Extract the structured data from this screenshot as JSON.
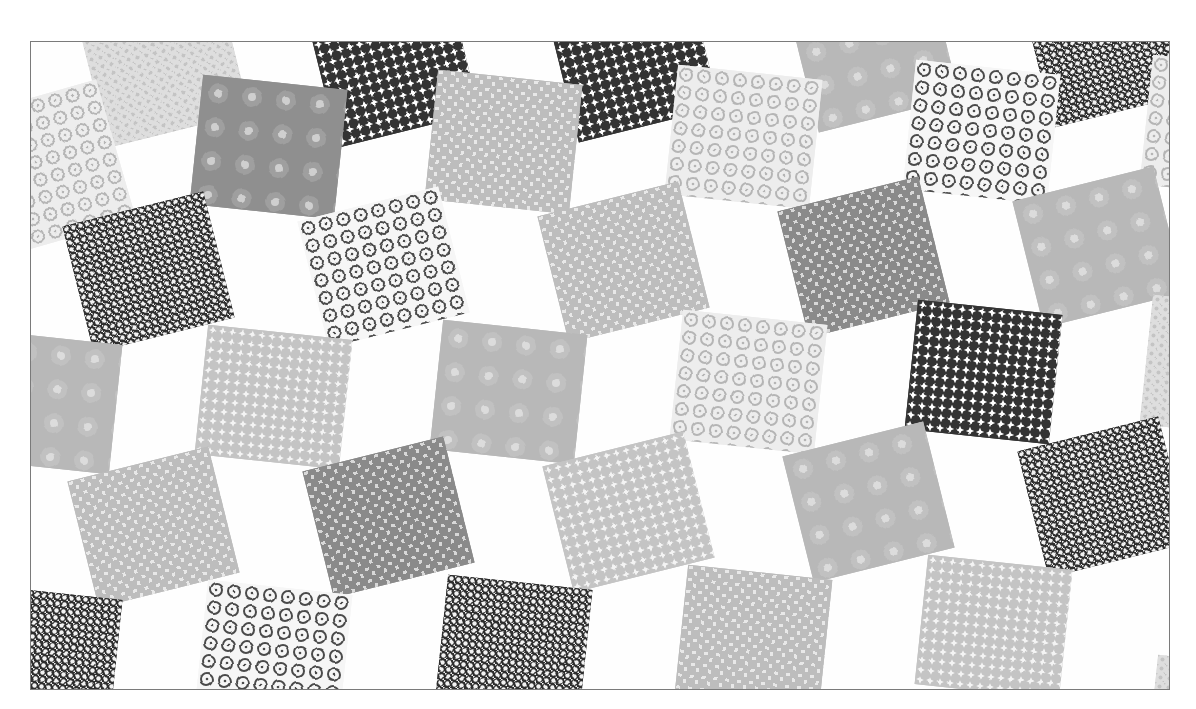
{
  "image": {
    "description": "Greyscale photograph of a patchwork quilt: rotated square print-fabric patches alternating with white rhombus patches in a tumbling-block style layout",
    "frame": {
      "left": 30,
      "top": 41,
      "width": 1140,
      "height": 649,
      "border_color": "#7a7a7a"
    },
    "background_color": "#ffffff"
  },
  "patterns": {
    "dark_floral": {
      "bg": "#2e2e2e",
      "fg": "#f2f2f2",
      "kind": "dots",
      "size": 7,
      "dot": 2.2
    },
    "dark_stars": {
      "bg": "#333333",
      "fg": "#ffffff",
      "kind": "stars",
      "size": 10,
      "dot": 2.6
    },
    "open_flowers": {
      "bg": "#f6f6f6",
      "fg": "#4a4a4a",
      "kind": "rings",
      "size": 18,
      "dot": 6
    },
    "weave_mid": {
      "bg": "#8a8a8a",
      "fg": "#d8d8d8",
      "kind": "weave",
      "size": 12,
      "dot": 3
    },
    "weave_light": {
      "bg": "#bdbdbd",
      "fg": "#e8e8e8",
      "kind": "weave",
      "size": 12,
      "dot": 3
    },
    "mottled_mid": {
      "bg": "#8f8f8f",
      "fg": "#cfcfcf",
      "kind": "spots",
      "size": 34,
      "dot": 4
    },
    "mottled_light": {
      "bg": "#b8b8b8",
      "fg": "#dcdcdc",
      "kind": "spots",
      "size": 34,
      "dot": 4
    },
    "pale_stars": {
      "bg": "#c4c4c4",
      "fg": "#f4f4f4",
      "kind": "stars",
      "size": 10,
      "dot": 2.4
    },
    "pale_flowers": {
      "bg": "#ededed",
      "fg": "#b5b5b5",
      "kind": "rings",
      "size": 18,
      "dot": 6
    },
    "pale_texture": {
      "bg": "#dedede",
      "fg": "#c4c4c4",
      "kind": "dots",
      "size": 9,
      "dot": 2
    }
  },
  "patches": [
    {
      "x": 60,
      "y": -40,
      "rot": -14,
      "pattern": "pale_texture"
    },
    {
      "x": 290,
      "y": -40,
      "rot": -14,
      "pattern": "dark_stars"
    },
    {
      "x": 530,
      "y": -45,
      "rot": -14,
      "pattern": "dark_stars"
    },
    {
      "x": 770,
      "y": -55,
      "rot": -14,
      "pattern": "mottled_light"
    },
    {
      "x": 1005,
      "y": -60,
      "rot": -14,
      "pattern": "dark_floral"
    },
    {
      "x": -50,
      "y": 60,
      "rot": 74,
      "pattern": "pale_flowers"
    },
    {
      "x": 165,
      "y": 40,
      "rot": 6,
      "pattern": "mottled_mid"
    },
    {
      "x": 400,
      "y": 35,
      "rot": 6,
      "pattern": "weave_light"
    },
    {
      "x": 640,
      "y": 30,
      "rot": 6,
      "pattern": "pale_flowers"
    },
    {
      "x": 878,
      "y": 25,
      "rot": 6,
      "pattern": "open_flowers"
    },
    {
      "x": 1115,
      "y": 20,
      "rot": 6,
      "pattern": "pale_flowers"
    },
    {
      "x": 45,
      "y": 165,
      "rot": -14,
      "pattern": "dark_floral"
    },
    {
      "x": 280,
      "y": 160,
      "rot": -14,
      "pattern": "open_flowers"
    },
    {
      "x": 520,
      "y": 155,
      "rot": -14,
      "pattern": "weave_light"
    },
    {
      "x": 760,
      "y": 150,
      "rot": -14,
      "pattern": "weave_mid"
    },
    {
      "x": 995,
      "y": 140,
      "rot": -14,
      "pattern": "mottled_light"
    },
    {
      "x": -60,
      "y": 295,
      "rot": 6,
      "pattern": "mottled_light"
    },
    {
      "x": 170,
      "y": 290,
      "rot": 6,
      "pattern": "pale_stars"
    },
    {
      "x": 405,
      "y": 285,
      "rot": 6,
      "pattern": "mottled_light"
    },
    {
      "x": 645,
      "y": 275,
      "rot": 6,
      "pattern": "pale_flowers"
    },
    {
      "x": 880,
      "y": 265,
      "rot": 6,
      "pattern": "dark_stars"
    },
    {
      "x": 1115,
      "y": 260,
      "rot": 6,
      "pattern": "pale_texture"
    },
    {
      "x": 50,
      "y": 420,
      "rot": -14,
      "pattern": "weave_light"
    },
    {
      "x": 285,
      "y": 410,
      "rot": -14,
      "pattern": "weave_mid"
    },
    {
      "x": 525,
      "y": 405,
      "rot": -14,
      "pattern": "pale_stars"
    },
    {
      "x": 765,
      "y": 395,
      "rot": -14,
      "pattern": "mottled_light"
    },
    {
      "x": 1000,
      "y": 390,
      "rot": -14,
      "pattern": "dark_floral"
    },
    {
      "x": -60,
      "y": 550,
      "rot": 6,
      "pattern": "dark_floral"
    },
    {
      "x": 170,
      "y": 545,
      "rot": 6,
      "pattern": "open_flowers"
    },
    {
      "x": 410,
      "y": 540,
      "rot": 6,
      "pattern": "dark_floral"
    },
    {
      "x": 650,
      "y": 530,
      "rot": 6,
      "pattern": "weave_light"
    },
    {
      "x": 890,
      "y": 520,
      "rot": 6,
      "pattern": "pale_stars"
    },
    {
      "x": 1120,
      "y": 620,
      "rot": 6,
      "pattern": "pale_texture"
    }
  ]
}
